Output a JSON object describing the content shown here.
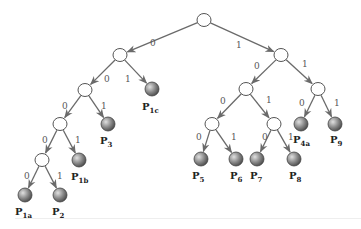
{
  "diagram": {
    "type": "binary-code-tree",
    "nodes": [
      {
        "id": "root",
        "x": 204,
        "y": 20,
        "kind": "inner"
      },
      {
        "id": "n0",
        "x": 120,
        "y": 55,
        "kind": "inner"
      },
      {
        "id": "n1",
        "x": 281,
        "y": 55,
        "kind": "inner"
      },
      {
        "id": "n00",
        "x": 85,
        "y": 90,
        "kind": "inner"
      },
      {
        "id": "P1c",
        "x": 152,
        "y": 89,
        "kind": "leaf",
        "label": "P",
        "sub": "1c"
      },
      {
        "id": "n000",
        "x": 60,
        "y": 124,
        "kind": "inner"
      },
      {
        "id": "P3",
        "x": 108,
        "y": 124,
        "kind": "leaf",
        "label": "P",
        "sub": "3"
      },
      {
        "id": "n0000",
        "x": 42,
        "y": 160,
        "kind": "inner"
      },
      {
        "id": "P1b",
        "x": 79,
        "y": 160,
        "kind": "leaf",
        "label": "P",
        "sub": "1b"
      },
      {
        "id": "P1a",
        "x": 25,
        "y": 195,
        "kind": "leaf",
        "label": "P",
        "sub": "1a"
      },
      {
        "id": "P2",
        "x": 60,
        "y": 195,
        "kind": "leaf",
        "label": "P",
        "sub": "2"
      },
      {
        "id": "n10",
        "x": 246,
        "y": 89,
        "kind": "inner"
      },
      {
        "id": "n11",
        "x": 318,
        "y": 89,
        "kind": "inner"
      },
      {
        "id": "P4a",
        "x": 301,
        "y": 124,
        "kind": "leaf",
        "label": "P",
        "sub": "4a"
      },
      {
        "id": "P9",
        "x": 335,
        "y": 124,
        "kind": "leaf",
        "label": "P",
        "sub": "9"
      },
      {
        "id": "n100",
        "x": 212,
        "y": 124,
        "kind": "inner"
      },
      {
        "id": "n101",
        "x": 274,
        "y": 124,
        "kind": "inner"
      },
      {
        "id": "P5",
        "x": 201,
        "y": 159,
        "kind": "leaf",
        "label": "P",
        "sub": "5"
      },
      {
        "id": "P6",
        "x": 236,
        "y": 159,
        "kind": "leaf",
        "label": "P",
        "sub": "6"
      },
      {
        "id": "P7",
        "x": 257,
        "y": 159,
        "kind": "leaf",
        "label": "P",
        "sub": "7"
      },
      {
        "id": "P8",
        "x": 294,
        "y": 159,
        "kind": "leaf",
        "label": "P",
        "sub": "8"
      }
    ],
    "edges": [
      {
        "from": "root",
        "to": "n0",
        "bit": "0",
        "lx": 150,
        "ly": 46
      },
      {
        "from": "root",
        "to": "n1",
        "bit": "1",
        "lx": 236,
        "ly": 48
      },
      {
        "from": "n0",
        "to": "n00",
        "bit": "0",
        "lx": 104,
        "ly": 82
      },
      {
        "from": "n0",
        "to": "P1c",
        "bit": "1",
        "lx": 125,
        "ly": 82
      },
      {
        "from": "n00",
        "to": "n000",
        "bit": "0",
        "lx": 62,
        "ly": 109
      },
      {
        "from": "n00",
        "to": "P3",
        "bit": "1",
        "lx": 101,
        "ly": 109
      },
      {
        "from": "n000",
        "to": "n0000",
        "bit": "0",
        "lx": 42,
        "ly": 143
      },
      {
        "from": "n000",
        "to": "P1b",
        "bit": "1",
        "lx": 75,
        "ly": 143
      },
      {
        "from": "n0000",
        "to": "P1a",
        "bit": "0",
        "lx": 24,
        "ly": 179
      },
      {
        "from": "n0000",
        "to": "P2",
        "bit": "1",
        "lx": 57,
        "ly": 179
      },
      {
        "from": "n1",
        "to": "n10",
        "bit": "0",
        "lx": 254,
        "ly": 69
      },
      {
        "from": "n1",
        "to": "n11",
        "bit": "1",
        "lx": 302,
        "ly": 67
      },
      {
        "from": "n10",
        "to": "n100",
        "bit": "0",
        "lx": 220,
        "ly": 104
      },
      {
        "from": "n10",
        "to": "n101",
        "bit": "1",
        "lx": 266,
        "ly": 103
      },
      {
        "from": "n11",
        "to": "P4a",
        "bit": "0",
        "lx": 299,
        "ly": 106
      },
      {
        "from": "n11",
        "to": "P9",
        "bit": "1",
        "lx": 334,
        "ly": 106
      },
      {
        "from": "n100",
        "to": "P5",
        "bit": "0",
        "lx": 196,
        "ly": 140
      },
      {
        "from": "n100",
        "to": "P6",
        "bit": "1",
        "lx": 231,
        "ly": 140
      },
      {
        "from": "n101",
        "to": "P7",
        "bit": "0",
        "lx": 262,
        "ly": 140
      },
      {
        "from": "n101",
        "to": "P8",
        "bit": "1",
        "lx": 288,
        "ly": 140
      }
    ],
    "leaf_labels": {
      "P1c": {
        "x": 142,
        "y": 110
      },
      "P3": {
        "x": 100,
        "y": 144
      },
      "P1b": {
        "x": 71,
        "y": 180
      },
      "P1a": {
        "x": 15,
        "y": 215
      },
      "P2": {
        "x": 52,
        "y": 215
      },
      "P4a": {
        "x": 293,
        "y": 143
      },
      "P9": {
        "x": 330,
        "y": 143
      },
      "P5": {
        "x": 192,
        "y": 179
      },
      "P6": {
        "x": 230,
        "y": 179
      },
      "P7": {
        "x": 250,
        "y": 179
      },
      "P8": {
        "x": 289,
        "y": 179
      }
    },
    "colors": {
      "edge": "#6a6a6a",
      "inner_fill": "#ffffff",
      "leaf_light": "#d8d8d8",
      "leaf_dark": "#5a5a5a",
      "label": "#222222"
    }
  }
}
